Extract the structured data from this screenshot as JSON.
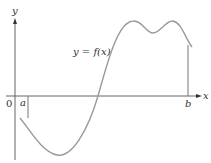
{
  "figure": {
    "type": "function-graph",
    "axis_labels": {
      "x": "x",
      "y": "y"
    },
    "origin_label": "0",
    "interval_markers": {
      "left": "a",
      "right": "b"
    },
    "curve_label": "y = f(x)",
    "colors": {
      "curve": "#9a9a9a",
      "axes": "#555555",
      "markers": "#777777",
      "text": "#333333"
    }
  }
}
